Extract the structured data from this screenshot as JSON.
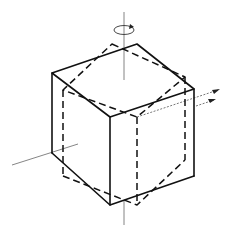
{
  "diagram": {
    "title": "",
    "colors": {
      "line": "#111111",
      "axis": "#666666",
      "background": "#ffffff"
    },
    "solid_cube": {
      "vertices": {
        "top": [
          137,
          44
        ],
        "left_top": [
          52,
          73
        ],
        "right_top": [
          194,
          89
        ],
        "front_top": [
          110,
          117
        ],
        "left_bottom": [
          52,
          153
        ],
        "right_bottom": [
          194,
          176
        ],
        "front_bottom": [
          110,
          205
        ]
      }
    },
    "dashed_cube": {
      "vertices": {
        "top": [
          112,
          44
        ],
        "left_top": [
          63,
          90
        ],
        "right_top": [
          185,
          77
        ],
        "front_top": [
          137,
          117
        ],
        "left_bottom": [
          63,
          176
        ],
        "right_bottom": [
          185,
          160
        ],
        "front_bottom": [
          137,
          205
        ]
      }
    },
    "axes": {
      "vertical": {
        "from": [
          124,
          12
        ],
        "to": [
          124,
          225
        ]
      },
      "horizontal_left": {
        "from": [
          12,
          165
        ],
        "to": [
          78,
          144
        ]
      }
    },
    "annotations": {
      "rotation_icon": "rotation-arrow",
      "right_arrows": "double-dashed-arrows"
    }
  }
}
